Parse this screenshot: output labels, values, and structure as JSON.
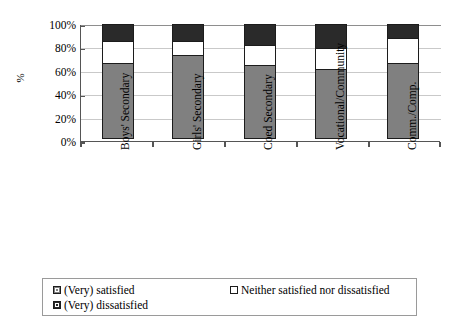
{
  "chart_data": {
    "type": "bar",
    "subtype": "stacked-100",
    "title": "",
    "xlabel": "",
    "ylabel": "%",
    "ylim": [
      0,
      100
    ],
    "ytick_labels": [
      "100%",
      "80%",
      "60%",
      "40%",
      "20%",
      "0%"
    ],
    "ytick_values": [
      100,
      80,
      60,
      40,
      20,
      0
    ],
    "grid": true,
    "legend_position": "bottom",
    "categories": [
      "Boys' Secondary",
      "Girls' Secondary",
      "Coed Secondary",
      "Vocational/Community",
      "Comm./Comp."
    ],
    "series": [
      {
        "name": "(Very) satisfied",
        "color": "#808080",
        "values": [
          65,
          72,
          63,
          60,
          65
        ]
      },
      {
        "name": "Neither satisfied nor dissatisfied",
        "color": "#ffffff",
        "values": [
          20,
          13,
          18,
          19,
          22
        ]
      },
      {
        "name": "(Very) dissatisfied",
        "color": "#2a2a2a",
        "values": [
          15,
          15,
          19,
          21,
          13
        ]
      }
    ]
  },
  "axes": {
    "y_title": "%",
    "ticks": [
      {
        "label": "100%"
      },
      {
        "label": "80%"
      },
      {
        "label": "60%"
      },
      {
        "label": "40%"
      },
      {
        "label": "20%"
      },
      {
        "label": "0%"
      }
    ]
  },
  "legend": {
    "items": [
      {
        "label": "(Very) satisfied",
        "swatch": "gray-swatch-icon"
      },
      {
        "label": "Neither satisfied nor dissatisfied",
        "swatch": "white-swatch-icon"
      },
      {
        "label": "(Very) dissatisfied",
        "swatch": "black-swatch-icon"
      }
    ]
  }
}
